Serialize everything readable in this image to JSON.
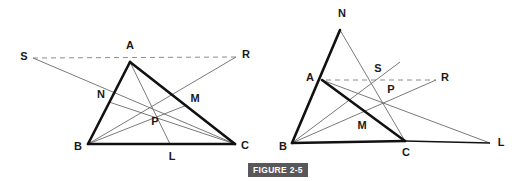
{
  "figure": {
    "caption": "FIGURE 2-5",
    "caption_bg_color": "#58585a",
    "caption_text_color": "#ffffff",
    "background_color": "#ffffff",
    "stroke_color_heavy": "#111111",
    "stroke_color_light": "#6b6b6b",
    "dash_color": "#8c8c8c"
  },
  "left_diagram": {
    "name": "triangle-abc-cevians-interior",
    "labels": {
      "A": "A",
      "B": "B",
      "C": "C",
      "N": "N",
      "M": "M",
      "P": "P",
      "L": "L",
      "S": "S",
      "R": "R"
    },
    "points": {
      "A": {
        "x": 130,
        "y": 62
      },
      "B": {
        "x": 88,
        "y": 144
      },
      "C": {
        "x": 235,
        "y": 144
      },
      "N": {
        "x": 109,
        "y": 102
      },
      "M": {
        "x": 187,
        "y": 105
      },
      "P": {
        "x": 156,
        "y": 112
      },
      "L": {
        "x": 170,
        "y": 144
      },
      "S": {
        "x": 33,
        "y": 58
      },
      "R": {
        "x": 236,
        "y": 57
      }
    },
    "label_offsets": {
      "A": {
        "x": 130,
        "y": 46
      },
      "B": {
        "x": 78,
        "y": 147
      },
      "C": {
        "x": 245,
        "y": 146
      },
      "N": {
        "x": 101,
        "y": 95
      },
      "M": {
        "x": 195,
        "y": 99
      },
      "P": {
        "x": 155,
        "y": 122
      },
      "L": {
        "x": 172,
        "y": 157
      },
      "S": {
        "x": 24,
        "y": 57
      },
      "R": {
        "x": 246,
        "y": 55
      }
    }
  },
  "right_diagram": {
    "name": "triangle-abc-cevians-exterior",
    "labels": {
      "A": "A",
      "B": "B",
      "C": "C",
      "N": "N",
      "M": "M",
      "P": "P",
      "L": "L",
      "S": "S",
      "R": "R"
    },
    "points": {
      "A": {
        "x": 322,
        "y": 80
      },
      "B": {
        "x": 292,
        "y": 143
      },
      "C": {
        "x": 405,
        "y": 141
      },
      "N": {
        "x": 340,
        "y": 30
      },
      "M": {
        "x": 372,
        "y": 118
      },
      "P": {
        "x": 384,
        "y": 99
      },
      "L": {
        "x": 490,
        "y": 143
      },
      "S": {
        "x": 374,
        "y": 80
      },
      "R": {
        "x": 436,
        "y": 80
      }
    },
    "label_offsets": {
      "A": {
        "x": 310,
        "y": 78
      },
      "B": {
        "x": 283,
        "y": 147
      },
      "C": {
        "x": 406,
        "y": 153
      },
      "N": {
        "x": 342,
        "y": 14
      },
      "M": {
        "x": 362,
        "y": 126
      },
      "P": {
        "x": 391,
        "y": 90
      },
      "L": {
        "x": 501,
        "y": 143
      },
      "S": {
        "x": 378,
        "y": 69
      },
      "R": {
        "x": 445,
        "y": 78
      }
    }
  }
}
